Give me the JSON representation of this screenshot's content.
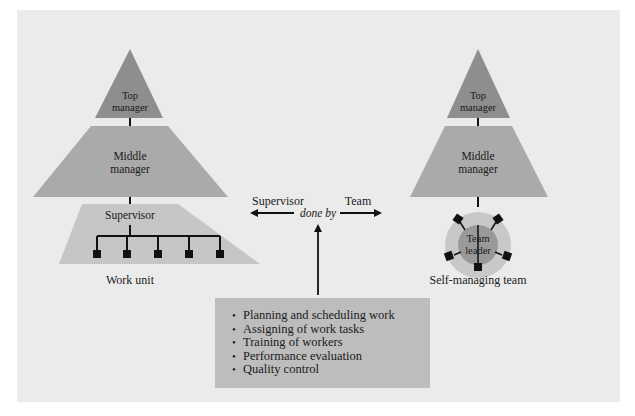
{
  "diagram": {
    "left_hierarchy": {
      "top_label_line1": "Top",
      "top_label_line2": "manager",
      "middle_label_line1": "Middle",
      "middle_label_line2": "manager",
      "supervisor_label": "Supervisor",
      "worker_count": 5,
      "caption": "Work unit"
    },
    "center": {
      "left_arrow_label": "Supervisor",
      "done_by_label": "done by",
      "right_arrow_label": "Team"
    },
    "right_hierarchy": {
      "top_label_line1": "Top",
      "top_label_line2": "manager",
      "middle_label_line1": "Middle",
      "middle_label_line2": "manager",
      "team_leader_line1": "Team",
      "team_leader_line2": "leader",
      "member_count": 5,
      "caption": "Self-managing team"
    },
    "tasks": {
      "items": [
        "Planning and scheduling work",
        "Assigning of work tasks",
        "Training of workers",
        "Performance evaluation",
        "Quality control"
      ]
    },
    "colors": {
      "panel": "#ebebeb",
      "top_level": "#8e8e8e",
      "middle_level": "#aaaaaa",
      "supervisor_level": "#c6c6c6",
      "task_box": "#bdbdbd",
      "circle_outer": "#c8c8c8",
      "circle_inner": "#999999",
      "ink": "#111111"
    }
  }
}
